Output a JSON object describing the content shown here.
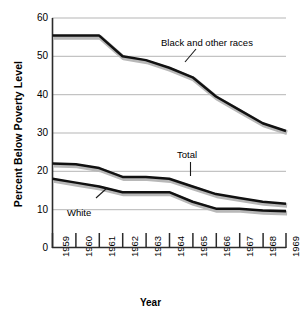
{
  "chart_data": {
    "type": "line",
    "title": "",
    "xlabel": "Year",
    "ylabel": "Percent Below Poverty Level",
    "categories": [
      "1959",
      "1960",
      "1961",
      "1962",
      "1963",
      "1964",
      "1965",
      "1966",
      "1967",
      "1968",
      "1969"
    ],
    "x": [
      1959,
      1960,
      1961,
      1962,
      1963,
      1964,
      1965,
      1966,
      1967,
      1968,
      1969
    ],
    "xlim": [
      1959,
      1969
    ],
    "ylim": [
      0,
      60
    ],
    "yticks": [
      0,
      10,
      20,
      30,
      40,
      50,
      60
    ],
    "ytick_labels": [
      "0",
      "10",
      "20",
      "30",
      "40",
      "50",
      "60"
    ],
    "grid": "horizontal",
    "legend": "inline-annotations",
    "series": [
      {
        "name": "Black and other races",
        "values": [
          55.4,
          55.4,
          55.4,
          50.0,
          49.0,
          47.0,
          44.5,
          39.5,
          36.0,
          32.5,
          30.5
        ]
      },
      {
        "name": "Total",
        "values": [
          22.0,
          21.8,
          20.8,
          18.5,
          18.5,
          18.0,
          16.0,
          14.0,
          13.0,
          12.0,
          11.5
        ]
      },
      {
        "name": "White",
        "values": [
          18.0,
          17.0,
          16.0,
          14.5,
          14.5,
          14.5,
          12.0,
          10.2,
          10.2,
          9.7,
          9.5
        ]
      }
    ],
    "annotations": [
      {
        "text": "Black and other races",
        "series": "Black and other races"
      },
      {
        "text": "Total",
        "series": "Total"
      },
      {
        "text": "White",
        "series": "White"
      }
    ],
    "colors": {
      "line": "#111111",
      "shadow": "#b8b8b8",
      "grid": "#b5b5b5",
      "axis": "#2b2b2b",
      "background": "#ffffff"
    }
  }
}
